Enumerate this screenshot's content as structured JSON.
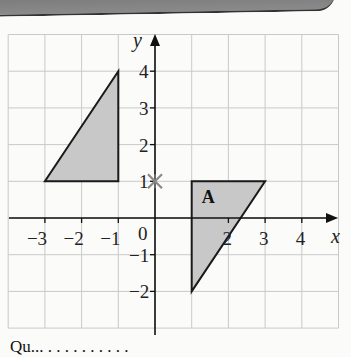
{
  "diagram": {
    "type": "coordinate-grid",
    "x_axis": {
      "label": "x",
      "min": -4,
      "max": 5,
      "ticks": [
        "-3",
        "-2",
        "-1",
        "0",
        "2",
        "3",
        "4"
      ]
    },
    "y_axis": {
      "label": "y",
      "min": -3,
      "max": 5,
      "ticks": [
        "4",
        "3",
        "2",
        "1",
        "-1",
        "-2"
      ]
    },
    "origin_label": "0",
    "shapes": [
      {
        "name": "object-triangle",
        "vertices": [
          [
            -3,
            1
          ],
          [
            -1,
            1
          ],
          [
            -1,
            4
          ]
        ],
        "fill": "#c8c8c8",
        "label": ""
      },
      {
        "name": "image-triangle-A",
        "vertices": [
          [
            1,
            1
          ],
          [
            3,
            1
          ],
          [
            1,
            -2
          ]
        ],
        "fill": "#c8c8c8",
        "label": "A"
      }
    ],
    "marker": {
      "name": "centre-of-rotation",
      "point": [
        0,
        1
      ],
      "symbol": "×",
      "color": "#888888"
    }
  },
  "caption": {
    "text": "Qu... . . . . . . . . . ."
  }
}
